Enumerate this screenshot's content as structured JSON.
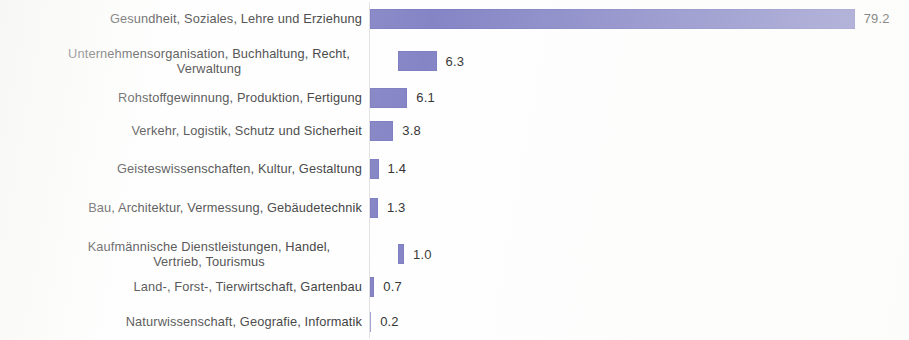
{
  "chart_data": {
    "type": "bar",
    "orientation": "horizontal",
    "title": "",
    "subtitle": "",
    "xlabel": "",
    "ylabel": "",
    "grid": false,
    "legend": null,
    "axis_ticks": [],
    "xlim": [
      0,
      79.2
    ],
    "bar_color": "#8585c6",
    "label_color": "#3b3b3b",
    "value_color": "#353535",
    "background": "#ffffff",
    "value_format": "one-decimal",
    "categories": [
      "Gesundheit, Soziales, Lehre und Erziehung",
      "Unternehmensorganisation, Buchhaltung, Recht, Verwaltung",
      "Rohstoffgewinnung, Produktion, Fertigung",
      "Verkehr, Logistik, Schutz und Sicherheit",
      "Geisteswissenschaften, Kultur, Gestaltung",
      "Bau, Architektur, Vermessung, Gebäudetechnik",
      "Kaufmännische Dienstleistungen, Handel, Vertrieb, Tourismus",
      "Land-, Forst-, Tierwirtschaft, Gartenbau",
      "Naturwissenschaft, Geografie, Informatik"
    ],
    "values": [
      79.2,
      6.3,
      6.1,
      3.8,
      1.4,
      1.3,
      1.0,
      0.7,
      0.2
    ],
    "value_labels": [
      "79.2",
      "6.3",
      "6.1",
      "3.8",
      "1.4",
      "1.3",
      "1.0",
      "0.7",
      "0.2"
    ]
  },
  "rows": [
    {
      "label": "Gesundheit, Soziales, Lehre und Erziehung",
      "value_label": "79.2",
      "value": 79.2,
      "wrapped": false
    },
    {
      "label": "Unternehmensorganisation, Buchhaltung, Recht,\nVerwaltung",
      "value_label": "6.3",
      "value": 6.3,
      "wrapped": true
    },
    {
      "label": "Rohstoffgewinnung, Produktion, Fertigung",
      "value_label": "6.1",
      "value": 6.1,
      "wrapped": false
    },
    {
      "label": "Verkehr, Logistik, Schutz und Sicherheit",
      "value_label": "3.8",
      "value": 3.8,
      "wrapped": false
    },
    {
      "label": "Geisteswissenschaften, Kultur, Gestaltung",
      "value_label": "1.4",
      "value": 1.4,
      "wrapped": false
    },
    {
      "label": "Bau, Architektur, Vermessung, Gebäudetechnik",
      "value_label": "1.3",
      "value": 1.3,
      "wrapped": false
    },
    {
      "label": "Kaufmännische Dienstleistungen, Handel,\nVertrieb, Tourismus",
      "value_label": "1.0",
      "value": 1.0,
      "wrapped": true
    },
    {
      "label": "Land-, Forst-, Tierwirtschaft, Gartenbau",
      "value_label": "0.7",
      "value": 0.7,
      "wrapped": false
    },
    {
      "label": "Naturwissenschaft, Geografie, Informatik",
      "value_label": "0.2",
      "value": 0.2,
      "wrapped": false
    }
  ],
  "layout": {
    "px_per_unit": 6.12,
    "bar_height": 20,
    "row_tops": [
      8,
      40,
      87,
      120,
      158,
      197,
      233,
      276,
      311
    ],
    "row_heights": [
      21,
      42,
      21,
      21,
      21,
      21,
      42,
      21,
      21
    ]
  }
}
